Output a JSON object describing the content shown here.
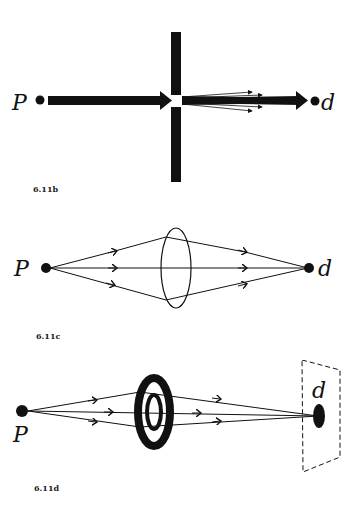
{
  "figures": [
    {
      "id": "fig-6-11b",
      "label": "6.11b",
      "description": "Beam from source P passes through small aperture in barrier and diffracts toward detector d",
      "source_label": "P",
      "detector_label": "d"
    },
    {
      "id": "fig-6-11c",
      "label": "6.11c",
      "description": "Rays from point P pass through convex lens and converge at point d",
      "source_label": "P",
      "detector_label": "d"
    },
    {
      "id": "fig-6-11d",
      "label": "6.11d",
      "description": "Rays from P pass through ring-shaped zone plate and focus onto spot d on a screen",
      "source_label": "P",
      "detector_label": "d"
    }
  ],
  "colors": {
    "ink": "#111111",
    "background": "#ffffff",
    "label": "#222222"
  }
}
